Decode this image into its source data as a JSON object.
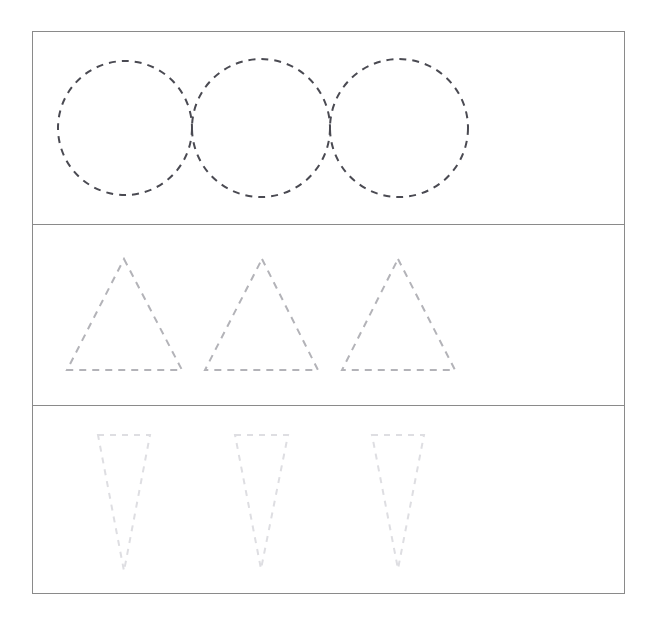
{
  "page": {
    "width": 658,
    "height": 617,
    "background": "#ffffff"
  },
  "frame": {
    "name": "worksheet-frame",
    "x": 32,
    "y": 31,
    "width": 593,
    "height": 563,
    "border_color": "#8a8a8a",
    "border_width": 1
  },
  "dividers": [
    {
      "label": "divider-row-1-2",
      "y": 224,
      "color": "#8a8a8a"
    },
    {
      "label": "divider-row-2-3",
      "y": 405,
      "color": "#8a8a8a"
    }
  ],
  "rows": [
    {
      "label": "Row 1 - Circles",
      "shape": "circle",
      "count": 3,
      "stroke_color": "#4a4a52",
      "stroke_width": 2,
      "dash_pattern": "7 6",
      "band": {
        "top": 32,
        "height": 192
      },
      "items": [
        {
          "label": "circle-1",
          "cx": 125,
          "cy": 128,
          "r": 67
        },
        {
          "label": "circle-2",
          "cx": 261,
          "cy": 128,
          "r": 69
        },
        {
          "label": "circle-3",
          "cx": 399,
          "cy": 128,
          "r": 69
        }
      ]
    },
    {
      "label": "Row 2 - Triangles",
      "shape": "triangle",
      "count": 3,
      "stroke_color": "#b3b3b8",
      "stroke_width": 2,
      "dash_pattern": "7 6",
      "band": {
        "top": 225,
        "height": 180
      },
      "items": [
        {
          "label": "triangle-1",
          "apex_x": 124,
          "apex_y": 259,
          "base_left_x": 67,
          "base_right_x": 182,
          "base_y": 370
        },
        {
          "label": "triangle-2",
          "apex_x": 262,
          "apex_y": 259,
          "base_left_x": 205,
          "base_right_x": 318,
          "base_y": 370
        },
        {
          "label": "triangle-3",
          "apex_x": 398,
          "apex_y": 259,
          "base_left_x": 342,
          "base_right_x": 455,
          "base_y": 370
        }
      ]
    },
    {
      "label": "Row 3 - Inverted Narrow Triangles",
      "shape": "inverted-triangle",
      "count": 3,
      "stroke_color": "#dedee2",
      "stroke_width": 2,
      "dash_pattern": "6 6",
      "band": {
        "top": 406,
        "height": 188
      },
      "items": [
        {
          "label": "inverted-triangle-1",
          "top_left_x": 98,
          "top_right_x": 150,
          "top_y": 435,
          "apex_x": 124,
          "apex_y": 571
        },
        {
          "label": "inverted-triangle-2",
          "top_left_x": 235,
          "top_right_x": 288,
          "top_y": 435,
          "apex_x": 261,
          "apex_y": 569
        },
        {
          "label": "inverted-triangle-3",
          "top_left_x": 372,
          "top_right_x": 424,
          "top_y": 435,
          "apex_x": 398,
          "apex_y": 569
        }
      ]
    }
  ]
}
